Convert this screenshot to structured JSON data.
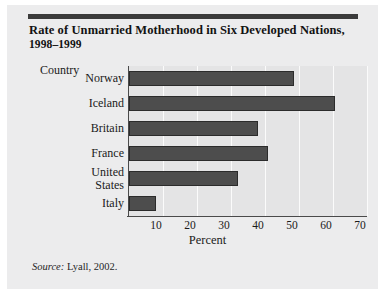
{
  "figure": {
    "title_line_1": "Rate of Unmarried Motherhood in Six Developed Nations,",
    "title_line_2": "1998–1999",
    "source": "Lyall, 2002.",
    "source_prefix": "Source:",
    "bar_color": "#4d4d4d",
    "background_color": "#ececed",
    "plot_background_color": "#e4e4e5"
  },
  "chart_data": {
    "type": "bar",
    "orientation": "horizontal",
    "title": "Rate of Unmarried Motherhood in Six Developed Nations, 1998–1999",
    "categories": [
      "Norway",
      "Iceland",
      "Britain",
      "France",
      "United\nStates",
      "Italy"
    ],
    "values": [
      48.5,
      60.5,
      38,
      41,
      32,
      8
    ],
    "xlabel": "Percent",
    "ylabel": "Country",
    "xlim": [
      0,
      70
    ],
    "xticks": [
      10,
      20,
      30,
      40,
      50,
      60,
      70
    ],
    "xtick_labels": [
      "10",
      "20",
      "30",
      "40",
      "50",
      "60",
      "70"
    ],
    "grid": true,
    "legend": false
  }
}
